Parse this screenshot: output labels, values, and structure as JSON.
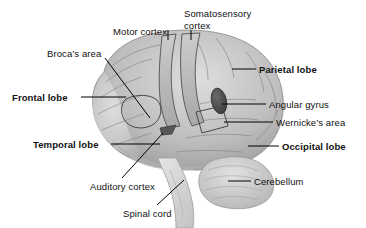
{
  "figure": {
    "background_color": "#ffffff",
    "text_color": "#111111",
    "leader_color": "#000000"
  },
  "illustration": {
    "name": "brain-lateral-view",
    "orientation": "facing left",
    "palette": {
      "cortex_light": "#d8d8d8",
      "cortex_mid": "#bcbcbc",
      "cortex_shade": "#9a9a9a",
      "sulcus_line": "#6e6e6e",
      "angular_gyrus_dark": "#4a4a4a",
      "auditory_dark": "#5a5a5a",
      "cerebellum": "#cfcfcf",
      "brainstem": "#dcdcdc",
      "outline": "#8a8a8a"
    }
  },
  "labels": [
    {
      "id": "motor-cortex",
      "text": "Motor cortex",
      "bold": false,
      "multiline": false,
      "x": 113,
      "y": 26
    },
    {
      "id": "somatosensory-cortex",
      "text": "Somatosensory cortex",
      "bold": false,
      "multiline": true,
      "x": 184,
      "y": 8
    },
    {
      "id": "brocas-area",
      "text": "Broca’s area",
      "bold": false,
      "multiline": false,
      "x": 47,
      "y": 48
    },
    {
      "id": "frontal-lobe",
      "text": "Frontal lobe",
      "bold": true,
      "multiline": false,
      "x": 12,
      "y": 92
    },
    {
      "id": "temporal-lobe",
      "text": "Temporal lobe",
      "bold": true,
      "multiline": false,
      "x": 33,
      "y": 139
    },
    {
      "id": "auditory-cortex",
      "text": "Auditory cortex",
      "bold": false,
      "multiline": false,
      "x": 90,
      "y": 181
    },
    {
      "id": "spinal-cord",
      "text": "Spinal cord",
      "bold": false,
      "multiline": false,
      "x": 123,
      "y": 208
    },
    {
      "id": "parietal-lobe",
      "text": "Parietal lobe",
      "bold": true,
      "multiline": false,
      "x": 259,
      "y": 64
    },
    {
      "id": "angular-gyrus",
      "text": "Angular gyrus",
      "bold": false,
      "multiline": false,
      "x": 269,
      "y": 99
    },
    {
      "id": "wernickes-area",
      "text": "Wernicke’s area",
      "bold": false,
      "multiline": false,
      "x": 276,
      "y": 117
    },
    {
      "id": "occipital-lobe",
      "text": "Occipital lobe",
      "bold": true,
      "multiline": false,
      "x": 282,
      "y": 141
    },
    {
      "id": "cerebellum",
      "text": "Cerebellum",
      "bold": false,
      "multiline": false,
      "x": 254,
      "y": 176
    }
  ]
}
